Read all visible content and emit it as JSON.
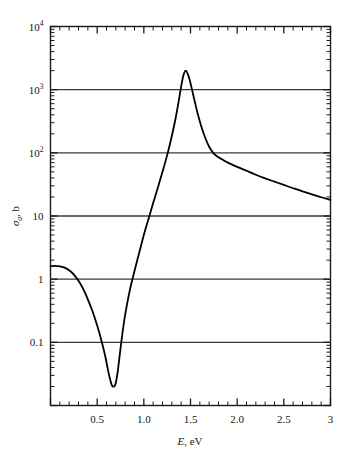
{
  "chart_data": {
    "type": "line",
    "title": "",
    "subtitle": "",
    "xlabel_italic": "E",
    "xlabel_rest": ", eV",
    "ylabel_symbol": "σ",
    "ylabel_sub": "a",
    "ylabel_rest": ", b",
    "xscale": "linear",
    "yscale": "log",
    "xlim": [
      0,
      3
    ],
    "ylim": [
      0.01,
      10000
    ],
    "grid": "horizontal major gridlines at decades",
    "legend": "none",
    "xticks": [
      "0.5",
      "1.0",
      "1.5",
      "2.0",
      "2.5",
      "3"
    ],
    "xtick_values": [
      0.5,
      1.0,
      1.5,
      2.0,
      2.5,
      3.0
    ],
    "ytick_labels": [
      {
        "mantissa": "10",
        "exp": "4",
        "value": 10000
      },
      {
        "mantissa": "10",
        "exp": "3",
        "value": 1000
      },
      {
        "mantissa": "10",
        "exp": "2",
        "value": 100
      },
      {
        "mantissa": "10",
        "exp": "",
        "value": 10
      },
      {
        "mantissa": "1",
        "exp": "",
        "value": 1
      },
      {
        "mantissa": "0.1",
        "exp": "",
        "value": 0.1
      }
    ],
    "gridline_values": [
      1000,
      100,
      10,
      1,
      0.1
    ],
    "line_color": "#000000",
    "axis_color": "#1a1a1a",
    "grid_color": "#3a3a3a",
    "background": "#ffffff",
    "series": [
      {
        "name": "absorption cross section",
        "x": [
          0.0,
          0.05,
          0.1,
          0.15,
          0.2,
          0.25,
          0.3,
          0.35,
          0.4,
          0.45,
          0.5,
          0.53,
          0.56,
          0.59,
          0.62,
          0.64,
          0.66,
          0.68,
          0.695,
          0.705,
          0.72,
          0.74,
          0.76,
          0.78,
          0.8,
          0.83,
          0.86,
          0.9,
          0.95,
          1.0,
          1.05,
          1.1,
          1.15,
          1.2,
          1.25,
          1.3,
          1.34,
          1.38,
          1.41,
          1.43,
          1.45,
          1.47,
          1.49,
          1.52,
          1.55,
          1.58,
          1.62,
          1.66,
          1.7,
          1.75,
          1.8,
          1.85,
          1.9,
          2.0,
          2.1,
          2.2,
          2.3,
          2.4,
          2.5,
          2.6,
          2.7,
          2.8,
          2.9,
          3.0
        ],
        "y": [
          1.6,
          1.62,
          1.6,
          1.52,
          1.38,
          1.18,
          0.94,
          0.7,
          0.48,
          0.31,
          0.185,
          0.13,
          0.088,
          0.057,
          0.034,
          0.0255,
          0.0205,
          0.02,
          0.0215,
          0.025,
          0.034,
          0.06,
          0.105,
          0.175,
          0.275,
          0.48,
          0.78,
          1.35,
          2.6,
          5.0,
          9.0,
          16.0,
          28.0,
          50.0,
          92.0,
          185.0,
          350.0,
          750.0,
          1350.0,
          1800.0,
          2000.0,
          1780.0,
          1450.0,
          950.0,
          610.0,
          400.0,
          250.0,
          170.0,
          125.0,
          97.0,
          85.0,
          77.0,
          70.0,
          60.0,
          52.0,
          45.0,
          39.5,
          35.0,
          31.0,
          27.5,
          24.5,
          22.0,
          19.8,
          18.0
        ]
      }
    ],
    "annotations": []
  }
}
